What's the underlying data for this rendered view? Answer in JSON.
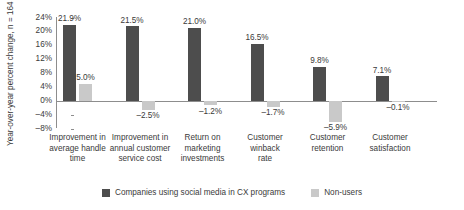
{
  "chart_data": {
    "type": "bar",
    "title": "",
    "subtitle": "",
    "xlabel": "",
    "ylabel": "Year-over-year percent change, n = 164",
    "ylim": [
      -8,
      24
    ],
    "ytick_labels": [
      "24%",
      "20%",
      "16%",
      "12%",
      "8%",
      "4%",
      "0%",
      "–4%",
      "–8%"
    ],
    "ytick_values": [
      24,
      20,
      16,
      12,
      8,
      4,
      0,
      -4,
      -8
    ],
    "grid": false,
    "legend_position": "bottom",
    "categories": [
      "Improvement in average handle time",
      "Improvement in annual customer service cost",
      "Return on marketing investments",
      "Customer winback rate",
      "Customer retention",
      "Customer satisfaction"
    ],
    "category_lines": [
      [
        "Improvement in",
        "average handle",
        "time"
      ],
      [
        "Improvement in",
        "annual customer",
        "service cost"
      ],
      [
        "Return on",
        "marketing",
        "investments"
      ],
      [
        "Customer",
        "winback",
        "rate"
      ],
      [
        "Customer",
        "retention"
      ],
      [
        "Customer",
        "satisfaction"
      ]
    ],
    "series": [
      {
        "name": "Companies using social media in CX programs",
        "color": "#4d4d4d",
        "values": [
          21.9,
          21.5,
          21.0,
          16.5,
          9.8,
          7.1
        ],
        "labels": [
          "21.9%",
          "21.5%",
          "21.0%",
          "16.5%",
          "9.8%",
          "7.1%"
        ]
      },
      {
        "name": "Non-users",
        "color": "#c9c9c9",
        "values": [
          5.0,
          -2.5,
          -1.2,
          -1.7,
          -5.9,
          -0.1
        ],
        "labels": [
          "5.0%",
          "–2.5%",
          "–1.2%",
          "–1.7%",
          "–5.9%",
          "–0.1%"
        ]
      }
    ]
  },
  "legend": {
    "items": [
      {
        "label": "Companies using social media in CX programs",
        "color": "#4d4d4d"
      },
      {
        "label": "Non-users",
        "color": "#c9c9c9"
      }
    ]
  },
  "colors": {
    "dark_series": "#4d4d4d",
    "light_series": "#c9c9c9",
    "axis": "#8d8d8d",
    "text": "#3a3a3a",
    "background": "#ffffff"
  }
}
